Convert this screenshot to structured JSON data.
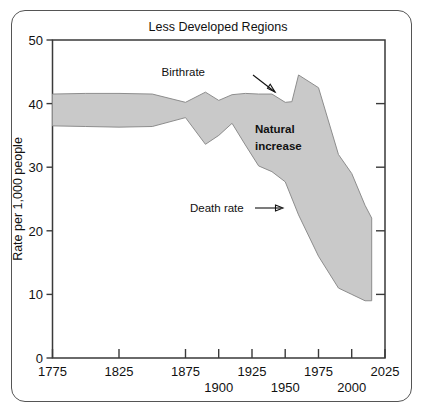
{
  "figure": {
    "title": "Less Developed Regions",
    "frame": true
  },
  "chart_data": {
    "type": "area",
    "title": "Less Developed Regions",
    "xlabel": "",
    "ylabel": "Rate per 1,000 people",
    "xlim": [
      1775,
      2025
    ],
    "ylim": [
      0,
      50
    ],
    "grid": false,
    "legend_position": "inline-annotations",
    "xticks": [
      1775,
      1825,
      1875,
      1900,
      1925,
      1950,
      1975,
      2000,
      2025
    ],
    "xticklabels": [
      "1775",
      "1825",
      "1875",
      "1900",
      "1925",
      "1950",
      "1975",
      "2000",
      "2025"
    ],
    "xticklabel_rows": [
      0,
      0,
      0,
      1,
      0,
      1,
      0,
      1,
      0
    ],
    "yticks": [
      0,
      10,
      20,
      30,
      40,
      50
    ],
    "yticklabels": [
      "0",
      "10",
      "20",
      "30",
      "40",
      "50"
    ],
    "fill_color": "#c9c9c9",
    "fill_label": "Natural increase",
    "series": [
      {
        "name": "Birthrate",
        "x": [
          1775,
          1800,
          1825,
          1850,
          1875,
          1890,
          1900,
          1910,
          1920,
          1930,
          1940,
          1950,
          1955,
          1960,
          1975,
          1990,
          2000,
          2010,
          2015
        ],
        "values": [
          41.5,
          41.6,
          41.6,
          41.5,
          40.2,
          41.8,
          40.5,
          41.4,
          41.6,
          41.5,
          41.5,
          40.2,
          40.3,
          44.5,
          42.5,
          32.0,
          29.0,
          24.0,
          22.0
        ]
      },
      {
        "name": "Death rate",
        "x": [
          1775,
          1800,
          1825,
          1850,
          1875,
          1890,
          1900,
          1910,
          1920,
          1930,
          1940,
          1950,
          1960,
          1975,
          1990,
          2000,
          2010,
          2015
        ],
        "values": [
          36.5,
          36.4,
          36.3,
          36.4,
          37.8,
          33.6,
          35.0,
          36.9,
          33.5,
          30.2,
          29.3,
          27.7,
          22.5,
          16.0,
          11.0,
          10.0,
          9.0,
          9.0
        ]
      }
    ],
    "annotations": [
      {
        "name": "birthrate-label",
        "text": "Birthrate",
        "arrow": "down-right"
      },
      {
        "name": "death-rate-label",
        "text": "Death rate",
        "arrow": "right"
      },
      {
        "name": "natural-increase-label",
        "text_line1": "Natural",
        "text_line2": "increase",
        "arrow": "none"
      }
    ]
  }
}
